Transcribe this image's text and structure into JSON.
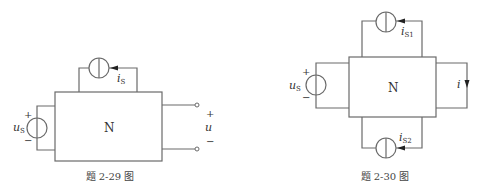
{
  "figures": [
    {
      "id": "fig-2-29",
      "caption": "题 2-29 图",
      "network_label": "N",
      "current_source": {
        "label": "i",
        "subscript": "S"
      },
      "voltage_source": {
        "label": "u",
        "subscript": "S",
        "plus": "+",
        "minus": "−"
      },
      "output_port": {
        "label": "u",
        "plus": "+",
        "minus": "−"
      }
    },
    {
      "id": "fig-2-30",
      "caption": "题 2-30 图",
      "network_label": "N",
      "current_source_top": {
        "label": "i",
        "subscript": "S1"
      },
      "current_source_bottom": {
        "label": "i",
        "subscript": "S2"
      },
      "voltage_source": {
        "label": "u",
        "subscript": "S",
        "plus": "+",
        "minus": "−"
      },
      "output_current": {
        "label": "i"
      }
    }
  ]
}
